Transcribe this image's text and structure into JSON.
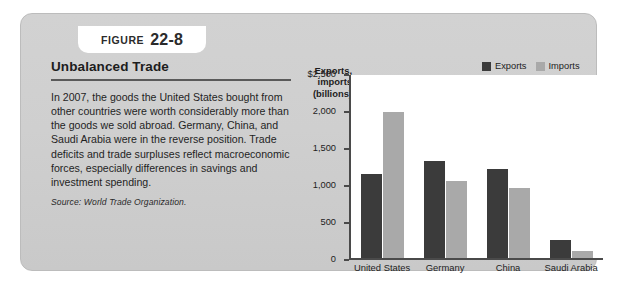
{
  "figure": {
    "label": "FIGURE",
    "number": "22-8"
  },
  "headline": "Unbalanced Trade",
  "body": {
    "paragraph": "In 2007, the goods the United States bought from other countries were worth considerably more than the goods we sold abroad. Germany, China, and Saudi Arabia were in the reverse position. Trade deficits and trade surpluses reflect macroeconomic forces, especially differences in savings and investment spending.",
    "source": "Source: World Trade Organization."
  },
  "colors": {
    "exports": "#3b3b3b",
    "imports": "#a9a9a9",
    "panel": "#cfcfcf",
    "plot_background": "#ffffff",
    "axis": "#4a4a4a"
  },
  "chart_data": {
    "type": "bar",
    "title": "",
    "ylabel": "Exports, imports (billions)",
    "ylabel_lines": [
      "Exports,",
      "imports",
      "(billions)"
    ],
    "xlabel": "",
    "categories": [
      "United States",
      "Germany",
      "China",
      "Saudi Arabia"
    ],
    "series": [
      {
        "name": "Exports",
        "values": [
          1150,
          1330,
          1220,
          250
        ]
      },
      {
        "name": "Imports",
        "values": [
          2000,
          1060,
          960,
          100
        ]
      }
    ],
    "ylim": [
      0,
      2500
    ],
    "yticks": [
      0,
      500,
      1000,
      1500,
      2000,
      2500
    ],
    "ytick_labels": [
      "0",
      "500",
      "1,000",
      "1,500",
      "2,000",
      "$2,500"
    ],
    "grid": false,
    "legend": [
      "Exports",
      "Imports"
    ],
    "legend_position": "top-right"
  }
}
